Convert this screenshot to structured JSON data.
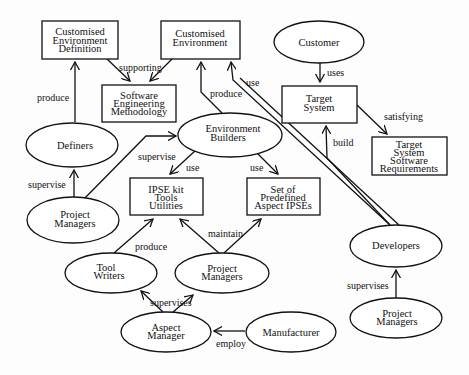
{
  "diagram": {
    "type": "role-relationship diagram",
    "nodes": {
      "ced": {
        "shape": "box",
        "lines": [
          "Customised",
          "Environment",
          "Definition"
        ]
      },
      "ce": {
        "shape": "box",
        "lines": [
          "Customised",
          "Environment"
        ]
      },
      "sem": {
        "shape": "box",
        "lines": [
          "Software",
          "Engineering",
          "Methodology"
        ]
      },
      "customer": {
        "shape": "ellipse",
        "lines": [
          "Customer"
        ]
      },
      "ts": {
        "shape": "box",
        "lines": [
          "Target",
          "System"
        ]
      },
      "tssr": {
        "shape": "box",
        "lines": [
          "Target",
          "System",
          "Software",
          "Requirements"
        ]
      },
      "definers": {
        "shape": "ellipse",
        "lines": [
          "Definers"
        ]
      },
      "eb": {
        "shape": "ellipse",
        "lines": [
          "Environment",
          "Builders"
        ]
      },
      "ipse": {
        "shape": "box",
        "lines": [
          "IPSE kit",
          "Tools",
          "Utilities"
        ]
      },
      "spa": {
        "shape": "box",
        "lines": [
          "Set of",
          "Predefined",
          "Aspect IPSEs"
        ]
      },
      "pm1": {
        "shape": "ellipse",
        "lines": [
          "Project",
          "Managers"
        ]
      },
      "tw": {
        "shape": "ellipse",
        "lines": [
          "Tool",
          "Writers"
        ]
      },
      "pm2": {
        "shape": "ellipse",
        "lines": [
          "Project",
          "Managers"
        ]
      },
      "am": {
        "shape": "ellipse",
        "lines": [
          "Aspect",
          "Manager"
        ]
      },
      "mfr": {
        "shape": "ellipse",
        "lines": [
          "Manufacturer"
        ]
      },
      "dev": {
        "shape": "ellipse",
        "lines": [
          "Developers"
        ]
      },
      "pm3": {
        "shape": "ellipse",
        "lines": [
          "Project",
          "Managers"
        ]
      }
    },
    "edges": [
      {
        "from": "Customised Environment Definition",
        "to": "Software Engineering Methodology",
        "label": "supporting"
      },
      {
        "from": "Customised Environment",
        "to": "Software Engineering Methodology",
        "label": ""
      },
      {
        "from": "Definers",
        "to": "Customised Environment Definition",
        "label": "produce"
      },
      {
        "from": "Environment Builders",
        "to": "Customised Environment",
        "label": "produce"
      },
      {
        "from": "Developers",
        "to": "Customised Environment",
        "label": "use"
      },
      {
        "from": "Customer",
        "to": "Target System",
        "label": "uses"
      },
      {
        "from": "Target System",
        "to": "Target System Software Requirements",
        "label": "satisfying"
      },
      {
        "from": "Developers",
        "to": "Target System",
        "label": "build"
      },
      {
        "from": "Project Managers",
        "to": "Definers",
        "label": "supervise"
      },
      {
        "from": "Project Managers",
        "to": "Environment Builders",
        "label": "supervise"
      },
      {
        "from": "Environment Builders",
        "to": "IPSE kit Tools Utilities",
        "label": "use"
      },
      {
        "from": "Environment Builders",
        "to": "Set of Predefined Aspect IPSEs",
        "label": "use"
      },
      {
        "from": "Tool Writers",
        "to": "IPSE kit Tools Utilities",
        "label": "produce"
      },
      {
        "from": "Project Managers",
        "to": "IPSE kit Tools Utilities",
        "label": "maintain"
      },
      {
        "from": "Project Managers",
        "to": "Set of Predefined Aspect IPSEs",
        "label": ""
      },
      {
        "from": "Aspect Manager",
        "to": "Tool Writers",
        "label": "supervises"
      },
      {
        "from": "Aspect Manager",
        "to": "Project Managers",
        "label": ""
      },
      {
        "from": "Manufacturer",
        "to": "Aspect Manager",
        "label": "employ"
      },
      {
        "from": "Project Managers",
        "to": "Developers",
        "label": "supervises"
      }
    ],
    "labels": {
      "supporting": "supporting",
      "produce1": "produce",
      "produce2": "produce",
      "use_dev": "use",
      "uses": "uses",
      "satisfying": "satisfying",
      "build": "build",
      "supervise1": "supervise",
      "supervise2": "supervise",
      "use1": "use",
      "use2": "use",
      "produce3": "produce",
      "maintain": "maintain",
      "supervises1": "supervises",
      "employ": "employ",
      "supervises2": "supervises"
    }
  }
}
